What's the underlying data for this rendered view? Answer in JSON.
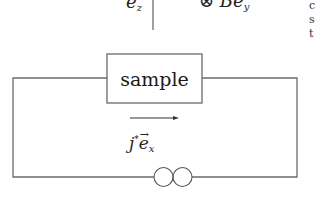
{
  "diagram": {
    "top_labels": {
      "ez_base": "e",
      "ez_sub": "z",
      "field_symbol": "⊗",
      "field_base": "Be",
      "field_sub": "y"
    },
    "sample_label": "sample",
    "current_label": {
      "base": "j",
      "star": "*",
      "vec": "e",
      "sub": "x"
    },
    "current_direction": "right",
    "source_symbol": "current-source",
    "right_edge_fragments": [
      "c",
      "s",
      "t"
    ],
    "colors": {
      "line": "#6b6b6b",
      "text": "#1a1a1a",
      "background": "#ffffff"
    }
  }
}
